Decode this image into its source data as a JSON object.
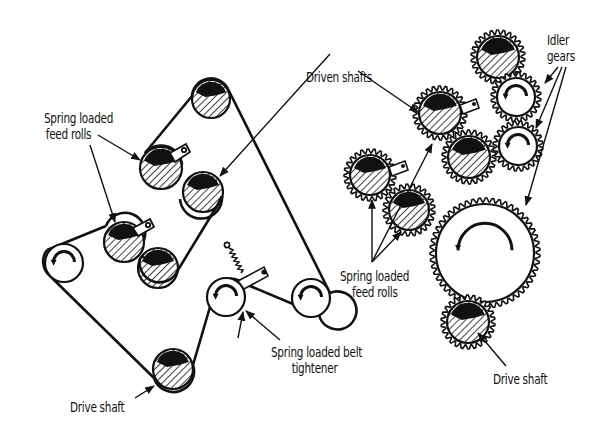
{
  "diagram": {
    "title": "",
    "left_system": {
      "type": "belt drive",
      "rollers": [
        {
          "id": "top-driven",
          "cx": 211,
          "cy": 99,
          "r": 19,
          "style": "hatched"
        },
        {
          "id": "upper-feed",
          "cx": 161,
          "cy": 168,
          "r": 21,
          "style": "hatched",
          "bracket": true
        },
        {
          "id": "upper-driven",
          "cx": 203,
          "cy": 192,
          "r": 20,
          "style": "hatched"
        },
        {
          "id": "left-idler",
          "cx": 64,
          "cy": 263,
          "r": 19,
          "style": "open"
        },
        {
          "id": "lower-feed",
          "cx": 124,
          "cy": 242,
          "r": 20,
          "style": "hatched",
          "bracket": true
        },
        {
          "id": "lower-driven",
          "cx": 158,
          "cy": 268,
          "r": 20,
          "style": "hatched"
        },
        {
          "id": "tightener",
          "cx": 226,
          "cy": 297,
          "r": 19,
          "style": "open"
        },
        {
          "id": "right-idler",
          "cx": 311,
          "cy": 298,
          "r": 19,
          "style": "open"
        },
        {
          "id": "drive-shaft",
          "cx": 173,
          "cy": 369,
          "r": 20,
          "style": "hatched"
        }
      ]
    },
    "right_system": {
      "type": "gear train",
      "gears": [
        {
          "id": "top-gear",
          "cx": 498,
          "cy": 57,
          "r": 22,
          "style": "hatched"
        },
        {
          "id": "idler-1",
          "cx": 516,
          "cy": 97,
          "r": 20,
          "style": "open"
        },
        {
          "id": "idler-2",
          "cx": 518,
          "cy": 146,
          "r": 20,
          "style": "open"
        },
        {
          "id": "driven-gear",
          "cx": 440,
          "cy": 113,
          "r": 22,
          "style": "hatched",
          "bracket": true
        },
        {
          "id": "middle-gear",
          "cx": 469,
          "cy": 157,
          "r": 22,
          "style": "hatched"
        },
        {
          "id": "feed-left",
          "cx": 370,
          "cy": 175,
          "r": 21,
          "style": "hatched",
          "bracket": true
        },
        {
          "id": "feed-right",
          "cx": 409,
          "cy": 210,
          "r": 21,
          "style": "hatched"
        },
        {
          "id": "big-gear",
          "cx": 485,
          "cy": 253,
          "r": 50,
          "style": "open"
        },
        {
          "id": "drive-gear",
          "cx": 468,
          "cy": 322,
          "r": 22,
          "style": "hatched"
        }
      ]
    },
    "labels": {
      "spring_feed_left_1": "Spring loaded",
      "spring_feed_left_2": "feed rolls",
      "driven_shafts": "Driven shafts",
      "idler_1": "Idler",
      "idler_2": "gears",
      "spring_feed_right_1": "Spring loaded",
      "spring_feed_right_2": "feed rolls",
      "belt_tightener_1": "Spring loaded belt",
      "belt_tightener_2": "tightener",
      "drive_shaft_left": "Drive shaft",
      "drive_shaft_right": "Drive shaft"
    },
    "colors": {
      "ink": "#111111",
      "background": "#ffffff"
    }
  }
}
